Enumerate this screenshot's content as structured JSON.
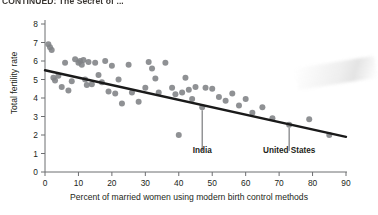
{
  "figure": {
    "title": "CONTINUED: The Secret of ...",
    "background_color": "#ffffff",
    "point_color": "#808285",
    "line_color": "#1a1a1a",
    "axis_color": "#6d6e71",
    "text_color": "#231f20"
  },
  "chart_data": {
    "type": "scatter",
    "title": "CONTINUED: The Secret of ...",
    "xlabel": "Percent of married women using modern birth control methods",
    "ylabel": "Total fertility rate",
    "xlim": [
      0,
      90
    ],
    "ylim": [
      0,
      8
    ],
    "xticks": [
      0,
      10,
      20,
      30,
      40,
      50,
      60,
      70,
      80,
      90
    ],
    "yticks": [
      0,
      1,
      2,
      3,
      4,
      5,
      6,
      7,
      8
    ],
    "grid": false,
    "legend": null,
    "marker_size_px": 6,
    "trendline": {
      "label": "linear fit",
      "x": [
        0,
        90
      ],
      "y": [
        5.5,
        1.9
      ]
    },
    "points": [
      {
        "x": 1,
        "y": 6.9
      },
      {
        "x": 1.5,
        "y": 6.75
      },
      {
        "x": 2,
        "y": 6.6
      },
      {
        "x": 2.5,
        "y": 5.1
      },
      {
        "x": 3,
        "y": 4.95
      },
      {
        "x": 4,
        "y": 5.2
      },
      {
        "x": 5,
        "y": 4.6
      },
      {
        "x": 6,
        "y": 5.9
      },
      {
        "x": 7,
        "y": 4.4
      },
      {
        "x": 8,
        "y": 4.9
      },
      {
        "x": 9,
        "y": 6.1
      },
      {
        "x": 10,
        "y": 5.9
      },
      {
        "x": 10.5,
        "y": 6.0
      },
      {
        "x": 11,
        "y": 5.8
      },
      {
        "x": 11.5,
        "y": 6.05
      },
      {
        "x": 12,
        "y": 5.0
      },
      {
        "x": 12.5,
        "y": 4.7
      },
      {
        "x": 13,
        "y": 5.95
      },
      {
        "x": 14,
        "y": 4.75
      },
      {
        "x": 15,
        "y": 5.9
      },
      {
        "x": 16,
        "y": 5.25
      },
      {
        "x": 17,
        "y": 4.85
      },
      {
        "x": 18,
        "y": 6.0
      },
      {
        "x": 19,
        "y": 4.35
      },
      {
        "x": 20,
        "y": 5.75
      },
      {
        "x": 21,
        "y": 4.25
      },
      {
        "x": 22,
        "y": 5.0
      },
      {
        "x": 23,
        "y": 3.7
      },
      {
        "x": 25,
        "y": 5.8
      },
      {
        "x": 26,
        "y": 4.3
      },
      {
        "x": 28,
        "y": 3.8
      },
      {
        "x": 30,
        "y": 4.55
      },
      {
        "x": 31,
        "y": 5.95
      },
      {
        "x": 32,
        "y": 5.6
      },
      {
        "x": 33,
        "y": 5.05
      },
      {
        "x": 34,
        "y": 4.3
      },
      {
        "x": 36,
        "y": 5.9
      },
      {
        "x": 38,
        "y": 4.55
      },
      {
        "x": 39,
        "y": 4.2
      },
      {
        "x": 40,
        "y": 2.0
      },
      {
        "x": 41,
        "y": 4.3
      },
      {
        "x": 42,
        "y": 5.1
      },
      {
        "x": 43,
        "y": 4.45
      },
      {
        "x": 44,
        "y": 3.95
      },
      {
        "x": 45,
        "y": 4.6
      },
      {
        "x": 47,
        "y": 3.5,
        "label": "India"
      },
      {
        "x": 48,
        "y": 4.55
      },
      {
        "x": 50,
        "y": 4.5
      },
      {
        "x": 52,
        "y": 4.05
      },
      {
        "x": 54,
        "y": 3.85
      },
      {
        "x": 56,
        "y": 4.25
      },
      {
        "x": 58,
        "y": 3.6
      },
      {
        "x": 60,
        "y": 3.95
      },
      {
        "x": 62,
        "y": 3.2
      },
      {
        "x": 65,
        "y": 3.5
      },
      {
        "x": 68,
        "y": 2.9
      },
      {
        "x": 73,
        "y": 2.55,
        "label": "United States"
      },
      {
        "x": 79,
        "y": 2.85
      },
      {
        "x": 85,
        "y": 2.0
      }
    ],
    "annotations": [
      {
        "text": "India",
        "point_x": 47,
        "point_y": 3.5,
        "label_x": 47,
        "label_y": 1.35
      },
      {
        "text": "United States",
        "point_x": 73,
        "point_y": 2.55,
        "label_x": 73,
        "label_y": 1.35
      }
    ]
  }
}
